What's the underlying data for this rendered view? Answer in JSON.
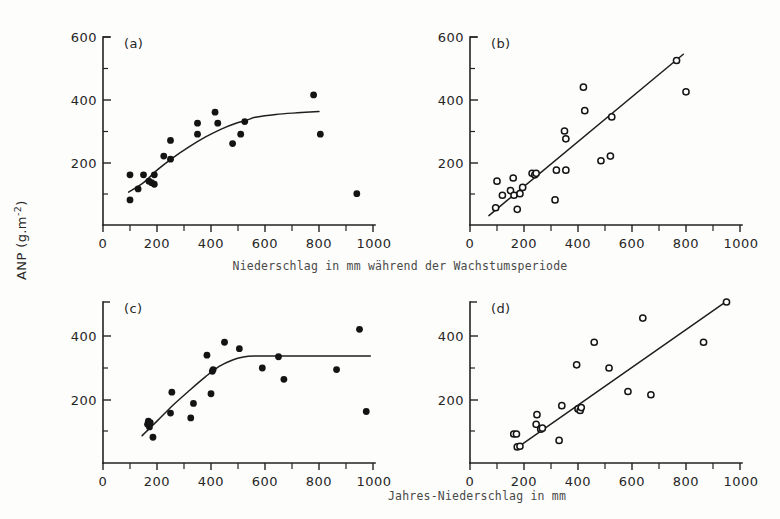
{
  "figure": {
    "background": "#fdfdfc",
    "ink_color": "#141414",
    "ylabel": "ANP (g.m",
    "ylabel_exponent": "-2",
    "ylabel_tail": ")",
    "ylabel_full": "ANP (g.m-2)",
    "caption_top": "Niederschlag in mm während der Wachstumsperiode",
    "caption_bottom": "Jahres-Niederschlag in mm",
    "panel_labels": {
      "a": "(a)",
      "b": "(b)",
      "c": "(c)",
      "d": "(d)"
    },
    "xtick_labels": [
      "0",
      "200",
      "400",
      "600",
      "800",
      "1000"
    ],
    "ytick_labels_top": [
      "200",
      "400",
      "600"
    ],
    "ytick_labels_bottom": [
      "200",
      "400"
    ]
  },
  "chart_data": [
    {
      "id": "panel-a",
      "type": "scatter",
      "title": "(a)",
      "xlabel": "Niederschlag in mm während der Wachstumsperiode",
      "ylabel": "ANP (g.m-2)",
      "xlim": [
        0,
        1000
      ],
      "ylim": [
        0,
        600
      ],
      "xticks": [
        0,
        200,
        400,
        600,
        800,
        1000
      ],
      "yticks": [
        0,
        200,
        400,
        600
      ],
      "grid": false,
      "legend": false,
      "marker": "filled-circle",
      "points": [
        [
          100,
          80
        ],
        [
          100,
          160
        ],
        [
          130,
          115
        ],
        [
          150,
          160
        ],
        [
          170,
          140
        ],
        [
          180,
          135
        ],
        [
          190,
          160
        ],
        [
          190,
          130
        ],
        [
          225,
          220
        ],
        [
          250,
          210
        ],
        [
          250,
          270
        ],
        [
          350,
          290
        ],
        [
          350,
          325
        ],
        [
          415,
          360
        ],
        [
          425,
          325
        ],
        [
          480,
          260
        ],
        [
          510,
          290
        ],
        [
          525,
          330
        ],
        [
          780,
          415
        ],
        [
          805,
          290
        ],
        [
          940,
          100
        ]
      ],
      "fit": {
        "type": "piecewise-saturating",
        "description": "rising line from (95,105) curving to plateau near 360 beyond x=540",
        "path": [
          [
            95,
            105
          ],
          [
            150,
            135
          ],
          [
            200,
            175
          ],
          [
            260,
            215
          ],
          [
            320,
            250
          ],
          [
            380,
            281
          ],
          [
            440,
            307
          ],
          [
            490,
            324
          ],
          [
            530,
            334
          ],
          [
            570,
            345
          ],
          [
            640,
            353
          ],
          [
            720,
            358
          ],
          [
            800,
            362
          ]
        ]
      }
    },
    {
      "id": "panel-b",
      "type": "scatter",
      "title": "(b)",
      "xlabel": "Niederschlag in mm während der Wachstumsperiode",
      "ylabel": "ANP (g.m-2)",
      "xlim": [
        0,
        1000
      ],
      "ylim": [
        0,
        600
      ],
      "xticks": [
        0,
        200,
        400,
        600,
        800,
        1000
      ],
      "yticks": [
        0,
        200,
        400,
        600
      ],
      "grid": false,
      "legend": false,
      "marker": "open-circle",
      "points": [
        [
          95,
          55
        ],
        [
          100,
          140
        ],
        [
          120,
          95
        ],
        [
          150,
          110
        ],
        [
          160,
          150
        ],
        [
          163,
          95
        ],
        [
          175,
          50
        ],
        [
          185,
          100
        ],
        [
          195,
          120
        ],
        [
          230,
          165
        ],
        [
          240,
          160
        ],
        [
          245,
          165
        ],
        [
          315,
          80
        ],
        [
          320,
          175
        ],
        [
          355,
          175
        ],
        [
          350,
          300
        ],
        [
          355,
          275
        ],
        [
          420,
          440
        ],
        [
          425,
          365
        ],
        [
          485,
          205
        ],
        [
          520,
          220
        ],
        [
          525,
          345
        ],
        [
          765,
          525
        ],
        [
          800,
          425
        ]
      ],
      "fit": {
        "type": "linear",
        "description": "straight regression line",
        "path": [
          [
            70,
            30
          ],
          [
            790,
            545
          ]
        ]
      }
    },
    {
      "id": "panel-c",
      "type": "scatter",
      "title": "(c)",
      "xlabel": "Jahres-Niederschlag in mm",
      "ylabel": "ANP (g.m-2)",
      "xlim": [
        0,
        1000
      ],
      "ylim": [
        0,
        500
      ],
      "xticks": [
        0,
        200,
        400,
        600,
        800,
        1000
      ],
      "yticks": [
        0,
        200,
        400
      ],
      "grid": false,
      "legend": false,
      "marker": "filled-circle",
      "points": [
        [
          165,
          120
        ],
        [
          168,
          130
        ],
        [
          172,
          112
        ],
        [
          175,
          125
        ],
        [
          185,
          80
        ],
        [
          250,
          155
        ],
        [
          255,
          220
        ],
        [
          325,
          140
        ],
        [
          335,
          185
        ],
        [
          385,
          335
        ],
        [
          400,
          215
        ],
        [
          405,
          285
        ],
        [
          408,
          290
        ],
        [
          450,
          375
        ],
        [
          505,
          355
        ],
        [
          590,
          295
        ],
        [
          650,
          330
        ],
        [
          670,
          260
        ],
        [
          865,
          290
        ],
        [
          950,
          415
        ],
        [
          975,
          160
        ]
      ],
      "fit": {
        "type": "piecewise-plateau",
        "description": "rising line from (145,85) reaching plateau of 330 at about x=560 and flat to 1000",
        "path": [
          [
            145,
            85
          ],
          [
            200,
            130
          ],
          [
            260,
            180
          ],
          [
            320,
            225
          ],
          [
            380,
            268
          ],
          [
            430,
            300
          ],
          [
            480,
            320
          ],
          [
            520,
            329
          ],
          [
            560,
            332
          ],
          [
            650,
            332
          ],
          [
            800,
            332
          ],
          [
            990,
            332
          ]
        ]
      }
    },
    {
      "id": "panel-d",
      "type": "scatter",
      "title": "(d)",
      "xlabel": "Jahres-Niederschlag in mm",
      "ylabel": "ANP (g.m-2)",
      "xlim": [
        0,
        1000
      ],
      "ylim": [
        0,
        500
      ],
      "xticks": [
        0,
        200,
        400,
        600,
        800,
        1000
      ],
      "yticks": [
        0,
        200,
        400
      ],
      "grid": false,
      "legend": false,
      "marker": "open-circle",
      "points": [
        [
          162,
          90
        ],
        [
          172,
          90
        ],
        [
          175,
          50
        ],
        [
          185,
          52
        ],
        [
          245,
          120
        ],
        [
          248,
          150
        ],
        [
          262,
          105
        ],
        [
          268,
          108
        ],
        [
          330,
          70
        ],
        [
          340,
          178
        ],
        [
          400,
          168
        ],
        [
          408,
          163
        ],
        [
          412,
          172
        ],
        [
          395,
          305
        ],
        [
          460,
          375
        ],
        [
          515,
          295
        ],
        [
          585,
          222
        ],
        [
          640,
          450
        ],
        [
          670,
          212
        ],
        [
          865,
          375
        ],
        [
          950,
          500
        ]
      ],
      "fit": {
        "type": "linear",
        "description": "straight regression line",
        "path": [
          [
            175,
            48
          ],
          [
            955,
            505
          ]
        ]
      }
    }
  ]
}
